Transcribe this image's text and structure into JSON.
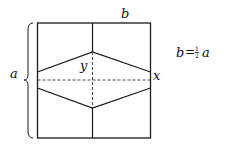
{
  "diagram": {
    "labels": {
      "b": "b",
      "a": "a",
      "y": "y",
      "x": "x"
    },
    "formula": {
      "lhs": "b",
      "eq": "=",
      "frac_num": "1",
      "frac_den": "2",
      "rhs": "a"
    },
    "line_color": "#1a1a1a"
  }
}
